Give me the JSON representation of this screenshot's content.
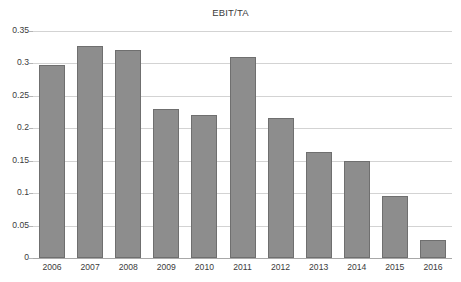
{
  "chart_data": {
    "type": "bar",
    "title": "EBIT/TA",
    "xlabel": "",
    "ylabel": "",
    "categories": [
      "2006",
      "2007",
      "2008",
      "2009",
      "2010",
      "2011",
      "2012",
      "2013",
      "2014",
      "2015",
      "2016"
    ],
    "values": [
      0.298,
      0.327,
      0.32,
      0.23,
      0.221,
      0.31,
      0.216,
      0.163,
      0.15,
      0.096,
      0.028
    ],
    "ylim": [
      0,
      0.35
    ],
    "ytick_labels": [
      "0",
      "0.05",
      "0.1",
      "0.15",
      "0.2",
      "0.25",
      "0.3",
      "0.35"
    ],
    "ytick_values": [
      0,
      0.05,
      0.1,
      0.15,
      0.2,
      0.25,
      0.3,
      0.35
    ],
    "grid": true,
    "legend_position": "bottom",
    "series_color": "#8d8d8d",
    "gridline_color": "#d3d3d3",
    "text_color": "#3b3b3b"
  }
}
